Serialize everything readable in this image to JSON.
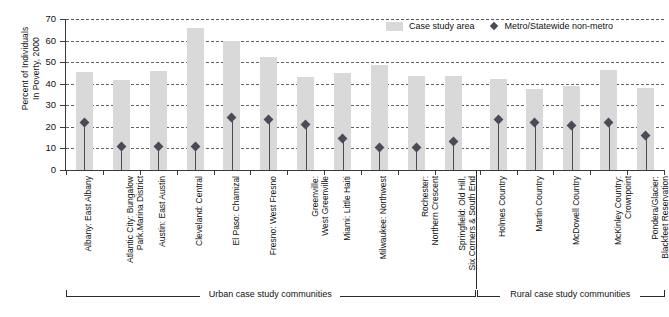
{
  "chart_data": {
    "type": "bar",
    "title": "",
    "xlabel": "",
    "ylabel": "Percent of Individuals In Poverty, 2000",
    "ylabel_line1": "Percent of Individuals",
    "ylabel_line2": "In Poverty, 2000",
    "ylim": [
      0,
      70
    ],
    "yticks": [
      0,
      10,
      20,
      30,
      40,
      50,
      60,
      70
    ],
    "grid": "horizontal-dashed",
    "legend_position": "top-right",
    "legend": [
      {
        "key": "bar",
        "label": "Case study area",
        "marker": "square-swatch",
        "color": "#d9d9d9"
      },
      {
        "key": "point",
        "label": "Metro/Statewide non-metro",
        "marker": "diamond",
        "color": "#4b4b57"
      }
    ],
    "series": [
      {
        "name": "Case study area",
        "values": [
          45.5,
          41.8,
          46.0,
          66.0,
          60.0,
          52.2,
          43.3,
          44.8,
          48.5,
          43.7,
          43.7,
          42.2,
          37.5,
          39.0,
          46.5,
          38.0
        ]
      },
      {
        "name": "Metro/Statewide non-metro",
        "values": [
          21.8,
          10.8,
          10.9,
          10.9,
          24.3,
          23.4,
          20.9,
          14.8,
          10.6,
          10.6,
          13.3,
          23.4,
          22.0,
          20.8,
          22.1,
          16.0
        ]
      }
    ],
    "categories": [
      {
        "line1": "Albany: East Albany",
        "line2": ""
      },
      {
        "line1": "Atlantic City: Bungalow",
        "line2": "Park.Marina District"
      },
      {
        "line1": "Austin: East Austin",
        "line2": ""
      },
      {
        "line1": "Cleveland: Central",
        "line2": ""
      },
      {
        "line1": "El Paso: Chamizal",
        "line2": ""
      },
      {
        "line1": "Fresno: West Fresno",
        "line2": ""
      },
      {
        "line1": "Greenville:",
        "line2": "West Greenville"
      },
      {
        "line1": "Miami: Little Haiti",
        "line2": ""
      },
      {
        "line1": "Milwaukee: Northwest",
        "line2": ""
      },
      {
        "line1": "Rochester:",
        "line2": "Northern Crescent"
      },
      {
        "line1": "Springfield: Old Hill,",
        "line2": "Six Corners & South End"
      },
      {
        "line1": "Holmes Country",
        "line2": ""
      },
      {
        "line1": "Martin Country",
        "line2": ""
      },
      {
        "line1": "McDowell Country",
        "line2": ""
      },
      {
        "line1": "McKinley Country:",
        "line2": "Crownpoint"
      },
      {
        "line1": "Pondera/Glacier:",
        "line2": "Blackfeet Reservation"
      }
    ],
    "groups": [
      {
        "label": "Urban case study communities",
        "start": 0,
        "end": 10
      },
      {
        "label": "Rural case study communities",
        "start": 11,
        "end": 15
      }
    ]
  }
}
